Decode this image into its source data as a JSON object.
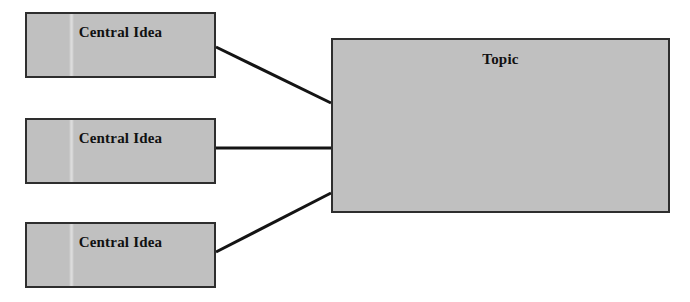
{
  "diagram": {
    "type": "concept-map",
    "background_color": "#ffffff",
    "canvas": {
      "width": 690,
      "height": 302
    },
    "style": {
      "node_fill": "#c0c0c0",
      "node_border": "#2e2e2e",
      "connector_color": "#141414",
      "connector_width": 3,
      "label_color": "#111111"
    },
    "nodes": [
      {
        "id": "idea-1",
        "label": "Central Idea",
        "role": "central-idea",
        "x": 25,
        "y": 12,
        "width": 191,
        "height": 66
      },
      {
        "id": "idea-2",
        "label": "Central Idea",
        "role": "central-idea",
        "x": 25,
        "y": 118,
        "width": 191,
        "height": 66
      },
      {
        "id": "idea-3",
        "label": "Central Idea",
        "role": "central-idea",
        "x": 25,
        "y": 222,
        "width": 191,
        "height": 66
      },
      {
        "id": "topic",
        "label": "Topic",
        "role": "topic",
        "x": 331,
        "y": 38,
        "width": 339,
        "height": 175
      }
    ],
    "connectors": [
      {
        "id": "link-1",
        "from": "idea-1",
        "to": "topic",
        "x1": 216,
        "y1": 47,
        "x2": 331,
        "y2": 103
      },
      {
        "id": "link-2",
        "from": "idea-2",
        "to": "topic",
        "x1": 216,
        "y1": 148,
        "x2": 331,
        "y2": 148
      },
      {
        "id": "link-3",
        "from": "idea-3",
        "to": "topic",
        "x1": 216,
        "y1": 252,
        "x2": 331,
        "y2": 193
      }
    ]
  }
}
